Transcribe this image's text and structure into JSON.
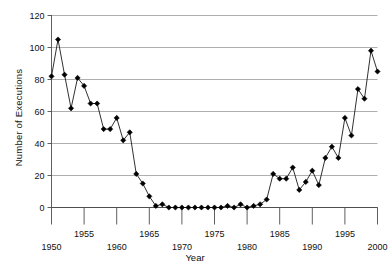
{
  "chart_data": {
    "type": "line",
    "title": "",
    "xlabel": "Year",
    "ylabel": "Number of Executions",
    "xlim": [
      1950,
      2000
    ],
    "ylim": [
      0,
      120
    ],
    "grid": true,
    "legend": null,
    "marker": "filled-diamond",
    "line_color": "#1a1a1a",
    "marker_color": "#000000",
    "grid_color": "#9a9a9a",
    "axis_color": "#4d4d4d",
    "y_ticks": [
      0,
      20,
      40,
      60,
      80,
      100,
      120
    ],
    "y_tick_labels": [
      "0",
      "20",
      "40",
      "60",
      "80",
      "100",
      "120"
    ],
    "x_ticks": [
      1950,
      1955,
      1960,
      1965,
      1970,
      1975,
      1980,
      1985,
      1990,
      1995,
      2000
    ],
    "x_tick_labels_lower_row": [
      "1950",
      "1960",
      "1970",
      "1980",
      "1990",
      "2000"
    ],
    "x_tick_labels_upper_row": [
      "1955",
      "1965",
      "1975",
      "1985",
      "1995"
    ],
    "x": [
      1950,
      1951,
      1952,
      1953,
      1954,
      1955,
      1956,
      1957,
      1958,
      1959,
      1960,
      1961,
      1962,
      1963,
      1964,
      1965,
      1966,
      1967,
      1968,
      1969,
      1970,
      1971,
      1972,
      1973,
      1974,
      1975,
      1976,
      1977,
      1978,
      1979,
      1980,
      1981,
      1982,
      1983,
      1984,
      1985,
      1986,
      1987,
      1988,
      1989,
      1990,
      1991,
      1992,
      1993,
      1994,
      1995,
      1996,
      1997,
      1998,
      1999,
      2000
    ],
    "values": [
      82,
      105,
      83,
      62,
      81,
      76,
      65,
      65,
      49,
      49,
      56,
      42,
      47,
      21,
      15,
      7,
      1,
      2,
      0,
      0,
      0,
      0,
      0,
      0,
      0,
      0,
      0,
      1,
      0,
      2,
      0,
      1,
      2,
      5,
      21,
      18,
      18,
      25,
      11,
      16,
      23,
      14,
      31,
      38,
      31,
      56,
      45,
      74,
      68,
      98,
      85
    ],
    "y_values_label": "Number of Executions"
  },
  "figure": {
    "ylabel": "Number of Executions",
    "xlabel": "Year"
  }
}
